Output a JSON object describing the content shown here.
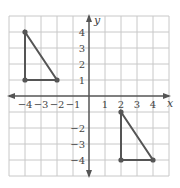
{
  "diagram": {
    "type": "coordinate-plane",
    "x_range": [
      -5,
      5
    ],
    "y_range": [
      -5,
      5
    ],
    "axis_labels": {
      "x": "x",
      "y": "y"
    },
    "x_ticks": [
      "−4",
      "−3",
      "−2",
      "−1",
      "1",
      "2",
      "3",
      "4"
    ],
    "y_ticks": [
      "4",
      "3",
      "2",
      "1",
      "−2",
      "−3",
      "−4"
    ],
    "colors": {
      "grid": "#c8c8c8",
      "axis": "#555555",
      "shape": "#555555",
      "tick_text": "#444444"
    },
    "shapes": [
      {
        "name": "triangle-1",
        "vertices": [
          [
            -4,
            4
          ],
          [
            -4,
            1
          ],
          [
            -2,
            1
          ]
        ]
      },
      {
        "name": "triangle-2",
        "vertices": [
          [
            2,
            -1
          ],
          [
            2,
            -4
          ],
          [
            4,
            -4
          ]
        ]
      }
    ]
  }
}
